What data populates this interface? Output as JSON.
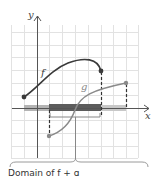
{
  "figure": {
    "axes": {
      "x_label": "x",
      "y_label": "y"
    },
    "functions": [
      {
        "name": "f",
        "label": "f",
        "color": "#3a3a3a",
        "domain_px": [
          24,
          101
        ],
        "endpoints": "closed-closed"
      },
      {
        "name": "g",
        "label": "g",
        "color": "#8a8a8a",
        "domain_px": [
          49,
          126
        ],
        "endpoints": "closed-closed"
      }
    ],
    "shaded_domains": {
      "f_domain_color": "#a8a8a8",
      "g_domain_color": "#c8c8c8",
      "intersection_color": "#555555"
    },
    "caption": "Domain of f + g"
  },
  "colors": {
    "grid": "#e2e2e2",
    "axis": "#555555",
    "f_curve": "#3a3a3a",
    "g_curve": "#8a8a8a",
    "brace": "#9a9a9a"
  }
}
